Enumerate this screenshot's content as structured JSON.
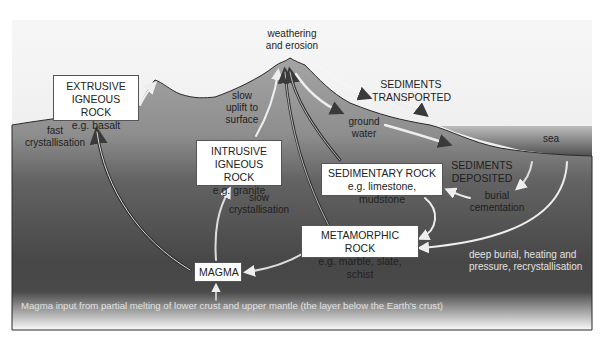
{
  "diagram": {
    "colors": {
      "sky_top": "#f7f7f7",
      "sky_bottom": "#e3e3e3",
      "ground_top": "#a3a3a3",
      "ground_bottom": "#444444",
      "sea_top": "#b5b5b5",
      "sea_bottom": "#4e4e4e",
      "box_fill": "#ffffff",
      "box_border": "#555555"
    },
    "boxes": {
      "extrusive": {
        "title_line1": "EXTRUSIVE",
        "title_line2": "IGNEOUS ROCK",
        "example": "e.g. basalt"
      },
      "intrusive": {
        "title_line1": "INTRUSIVE",
        "title_line2": "IGNEOUS ROCK",
        "example": "e.g. granite"
      },
      "sedimentary": {
        "title": "SEDIMENTARY ROCK",
        "example": "e.g. limestone, mudstone"
      },
      "metamorphic": {
        "title": "METAMORPHIC ROCK",
        "example": "e.g. marble, slate, schist"
      },
      "magma": {
        "title": "MAGMA"
      }
    },
    "labels": {
      "weathering_line1": "weathering",
      "weathering_line2": "and erosion",
      "sediments_transported_line1": "SEDIMENTS",
      "sediments_transported_line2": "TRANSPORTED",
      "ground_water_line1": "ground",
      "ground_water_line2": "water",
      "sea": "sea",
      "sediments_deposited_line1": "SEDIMENTS",
      "sediments_deposited_line2": "DEPOSITED",
      "burial_line1": "burial",
      "burial_line2": "cementation",
      "slow_uplift_line1": "slow",
      "slow_uplift_line2": "uplift to",
      "slow_uplift_line3": "surface",
      "fast_cryst_line1": "fast",
      "fast_cryst_line2": "crystallisation",
      "slow_cryst_line1": "slow",
      "slow_cryst_line2": "crystallisation",
      "deep_burial_line1": "deep burial, heating and",
      "deep_burial_line2": "pressure, recrystallisation",
      "magma_input": "Magma input from partial melting of lower crust and upper mantle (the layer below the Earth's crust)"
    }
  }
}
